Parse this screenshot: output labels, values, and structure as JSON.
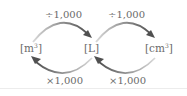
{
  "diagram": {
    "units": [
      {
        "id": "m3",
        "open": "[m",
        "sup": "3",
        "close": "]"
      },
      {
        "id": "L",
        "label": "[L]"
      },
      {
        "id": "cm3",
        "open": "[cm",
        "sup": "3",
        "close": "]"
      }
    ],
    "top_labels": [
      "÷1,000",
      "÷1,000"
    ],
    "bottom_labels": [
      "×1,000",
      "×1,000"
    ],
    "colors": {
      "text": "#6a6a6a",
      "arrow_dark": "#555555",
      "arrow_light": "#cfcfcf"
    }
  }
}
